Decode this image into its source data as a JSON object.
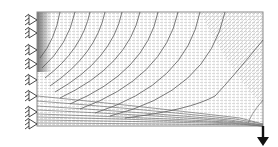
{
  "diagram": {
    "domain": {
      "x": 37,
      "y": 12,
      "width": 226,
      "height": 114
    },
    "colors": {
      "background": "#ffffff",
      "border": "#8a8a8a",
      "vector_field": "#b5b5b5",
      "trajectory": "#555555",
      "support": "#333333",
      "load": "#111111",
      "left_edge_shade": "#6e6e6e"
    },
    "supports": {
      "type": "fixed-pin",
      "side": "left",
      "count": 8,
      "y_positions": [
        20,
        33,
        50,
        64,
        80,
        96,
        112,
        124
      ]
    },
    "load": {
      "type": "point-force",
      "direction": "down",
      "x": 263,
      "y_start": 126,
      "y_end": 146
    },
    "trajectories": {
      "upper_family_count": 11,
      "lower_family_count": 9
    }
  }
}
